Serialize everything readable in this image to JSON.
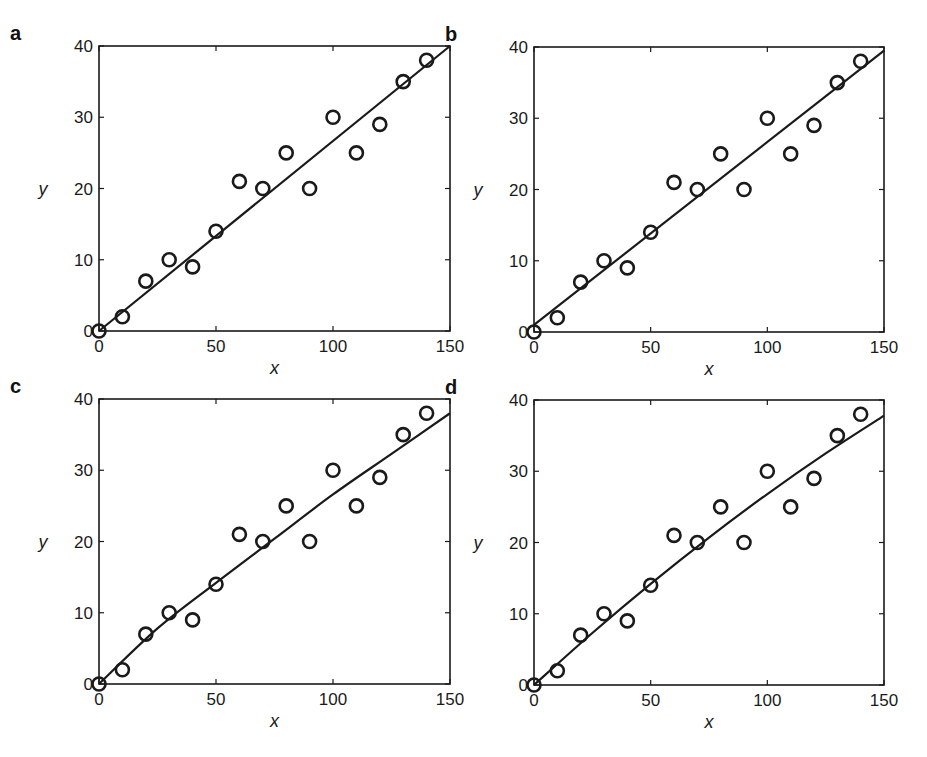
{
  "figure": {
    "background": "#ffffff",
    "ink_color": "#1a1a1a"
  },
  "chart_data": [
    {
      "panel": "a",
      "type": "scatter",
      "title": "",
      "xlabel": "x",
      "ylabel": "y",
      "xlim": [
        0,
        150
      ],
      "ylim": [
        0,
        40
      ],
      "xticks": [
        0,
        50,
        100,
        150
      ],
      "yticks": [
        0,
        10,
        20,
        30,
        40
      ],
      "grid": false,
      "legend": null,
      "points": {
        "x": [
          0,
          10,
          20,
          30,
          40,
          50,
          60,
          70,
          80,
          90,
          100,
          110,
          120,
          130,
          140
        ],
        "y": [
          0,
          2,
          7,
          10,
          9,
          14,
          21,
          20,
          25,
          20,
          30,
          25,
          29,
          35,
          38
        ]
      },
      "fit": {
        "kind": "linear through origin",
        "x": [
          0,
          150
        ],
        "y": [
          0,
          40
        ]
      }
    },
    {
      "panel": "b",
      "type": "scatter",
      "title": "",
      "xlabel": "x",
      "ylabel": "y",
      "xlim": [
        0,
        150
      ],
      "ylim": [
        0,
        40
      ],
      "xticks": [
        0,
        50,
        100,
        150
      ],
      "yticks": [
        0,
        10,
        20,
        30,
        40
      ],
      "grid": false,
      "legend": null,
      "points": {
        "x": [
          0,
          10,
          20,
          30,
          40,
          50,
          60,
          70,
          80,
          90,
          100,
          110,
          120,
          130,
          140
        ],
        "y": [
          0,
          2,
          7,
          10,
          9,
          14,
          21,
          20,
          25,
          20,
          30,
          25,
          29,
          35,
          38
        ]
      },
      "fit": {
        "kind": "linear with intercept",
        "x": [
          0,
          150
        ],
        "y": [
          1.0,
          39.5
        ]
      }
    },
    {
      "panel": "c",
      "type": "scatter",
      "title": "",
      "xlabel": "x",
      "ylabel": "y",
      "xlim": [
        0,
        150
      ],
      "ylim": [
        0,
        40
      ],
      "xticks": [
        0,
        50,
        100,
        150
      ],
      "yticks": [
        0,
        10,
        20,
        30,
        40
      ],
      "grid": false,
      "legend": null,
      "points": {
        "x": [
          0,
          10,
          20,
          30,
          40,
          50,
          60,
          70,
          80,
          90,
          100,
          110,
          120,
          130,
          140
        ],
        "y": [
          0,
          2,
          7,
          10,
          9,
          14,
          21,
          20,
          25,
          20,
          30,
          25,
          29,
          35,
          38
        ]
      },
      "fit": {
        "kind": "power law (slightly concave)",
        "x": [
          0,
          25,
          50,
          75,
          100,
          125,
          150
        ],
        "y": [
          0,
          7.8,
          14.2,
          20.4,
          26.6,
          32.3,
          38.0
        ]
      }
    },
    {
      "panel": "d",
      "type": "scatter",
      "title": "",
      "xlabel": "x",
      "ylabel": "y",
      "xlim": [
        0,
        150
      ],
      "ylim": [
        0,
        40
      ],
      "xticks": [
        0,
        50,
        100,
        150
      ],
      "yticks": [
        0,
        10,
        20,
        30,
        40
      ],
      "grid": false,
      "legend": null,
      "points": {
        "x": [
          0,
          10,
          20,
          30,
          40,
          50,
          60,
          70,
          80,
          90,
          100,
          110,
          120,
          130,
          140
        ],
        "y": [
          0,
          2,
          7,
          10,
          9,
          14,
          21,
          20,
          25,
          20,
          30,
          25,
          29,
          35,
          38
        ]
      },
      "fit": {
        "kind": "quadratic (slightly concave)",
        "x": [
          0,
          25,
          50,
          75,
          100,
          125,
          150
        ],
        "y": [
          0,
          7.3,
          14.2,
          20.7,
          26.8,
          32.5,
          37.8
        ]
      }
    }
  ],
  "panels": [
    {
      "label": "a",
      "xlabel": "x",
      "ylabel": "y",
      "box": {
        "left": 99,
        "top": 46,
        "right": 450,
        "bottom": 331
      }
    },
    {
      "label": "b",
      "xlabel": "x",
      "ylabel": "y",
      "box": {
        "left": 534,
        "top": 47,
        "right": 884,
        "bottom": 332
      }
    },
    {
      "label": "c",
      "xlabel": "x",
      "ylabel": "y",
      "box": {
        "left": 99,
        "top": 399,
        "right": 450,
        "bottom": 684
      }
    },
    {
      "label": "d",
      "xlabel": "x",
      "ylabel": "y",
      "box": {
        "left": 534,
        "top": 400,
        "right": 884,
        "bottom": 685
      }
    }
  ]
}
